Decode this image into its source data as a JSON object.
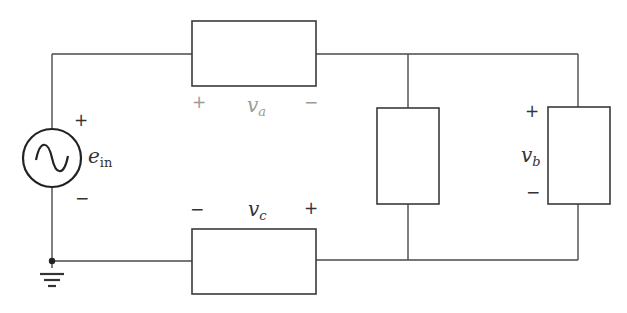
{
  "diagram": {
    "type": "circuit",
    "source": {
      "symbol": "ac-voltage-source",
      "label_main": "e",
      "label_sub": "in",
      "plus": "+",
      "minus": "−"
    },
    "elements": {
      "top": {
        "label_main": "v",
        "label_sub": "a",
        "plus": "+",
        "minus": "−"
      },
      "bottom": {
        "label_main": "v",
        "label_sub": "c",
        "plus": "+",
        "minus": "−"
      },
      "middle": {
        "label": ""
      },
      "right": {
        "label_main": "v",
        "label_sub": "b",
        "plus": "+",
        "minus": "−"
      }
    },
    "ground": {
      "symbol": "ground"
    },
    "colors": {
      "wire": "#4a4a4a",
      "box": "#3a3a3a",
      "background": "#ffffff"
    }
  }
}
